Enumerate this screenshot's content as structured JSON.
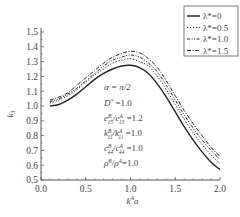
{
  "chart_data": {
    "type": "line",
    "title": "",
    "xlabel": "k^A a",
    "ylabel": "k_3",
    "xlim": [
      0.0,
      2.0
    ],
    "ylim": [
      0.5,
      1.5
    ],
    "xticks": [
      "0.0",
      "0.5",
      "1.0",
      "1.5",
      "2.0"
    ],
    "yticks": [
      "0.5",
      "0.6",
      "0.7",
      "0.8",
      "0.9",
      "1.0",
      "1.1",
      "1.2",
      "1.3",
      "1.4",
      "1.5"
    ],
    "grid": false,
    "legend_position": "upper right",
    "x": [
      0.1,
      0.2,
      0.3,
      0.4,
      0.5,
      0.6,
      0.7,
      0.8,
      0.9,
      1.0,
      1.1,
      1.2,
      1.3,
      1.4,
      1.5,
      1.6,
      1.7,
      1.8,
      1.9,
      2.0
    ],
    "series": [
      {
        "name": "λ*=0",
        "style": "solid",
        "values": [
          1.0,
          1.01,
          1.04,
          1.08,
          1.13,
          1.18,
          1.22,
          1.25,
          1.27,
          1.275,
          1.26,
          1.22,
          1.15,
          1.06,
          0.96,
          0.86,
          0.77,
          0.69,
          0.62,
          0.57
        ]
      },
      {
        "name": "λ*=0.5",
        "style": "dotted",
        "values": [
          1.02,
          1.04,
          1.07,
          1.11,
          1.16,
          1.21,
          1.25,
          1.29,
          1.31,
          1.32,
          1.3,
          1.27,
          1.2,
          1.11,
          1.01,
          0.91,
          0.82,
          0.74,
          0.67,
          0.61
        ]
      },
      {
        "name": "λ*=1.0",
        "style": "dashdot2",
        "values": [
          1.03,
          1.05,
          1.08,
          1.12,
          1.17,
          1.22,
          1.27,
          1.31,
          1.33,
          1.345,
          1.33,
          1.29,
          1.23,
          1.14,
          1.04,
          0.94,
          0.85,
          0.77,
          0.7,
          0.64
        ]
      },
      {
        "name": "λ*=1.5",
        "style": "dashdot",
        "values": [
          1.04,
          1.06,
          1.09,
          1.14,
          1.19,
          1.24,
          1.29,
          1.33,
          1.355,
          1.37,
          1.36,
          1.32,
          1.26,
          1.17,
          1.07,
          0.97,
          0.88,
          0.8,
          0.72,
          0.66
        ]
      }
    ],
    "annotations": [
      "α = π/2",
      "D* =1.0",
      "e15B/e15A =1.2",
      "k11B/k11A =1.0",
      "c44B/c44A =1.0",
      "ρB/ρA =1.0"
    ]
  },
  "legend": {
    "items": [
      "λ*=0",
      "λ*=0.5",
      "λ*=1.0",
      "λ*=1.5"
    ]
  },
  "axes": {
    "xlabel_main": "k",
    "xlabel_sup": "A",
    "xlabel_tail": "a",
    "ylabel_main": "k",
    "ylabel_sub": "3"
  },
  "annotation_lines": {
    "alpha": "α = π/2",
    "D": "D* =1.0",
    "e": "e15B/e15A =1.2",
    "k": "k11B/k11A =1.0",
    "c": "c44B/c44A =1.0",
    "rho": "ρB/ρA =1.0"
  }
}
